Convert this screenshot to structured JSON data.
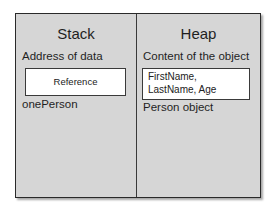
{
  "diagram": {
    "colors": {
      "panel_background": "#d6d6d6",
      "border": "#2a2a2a",
      "box_background": "#ffffff"
    },
    "stack": {
      "title": "Stack",
      "label": "Address of data",
      "box_text": "Reference",
      "variable_name": "onePerson"
    },
    "heap": {
      "title": "Heap",
      "label": "Content of the object",
      "box_text": "FirstName, LastName, Age",
      "object_name": "Person object"
    }
  }
}
